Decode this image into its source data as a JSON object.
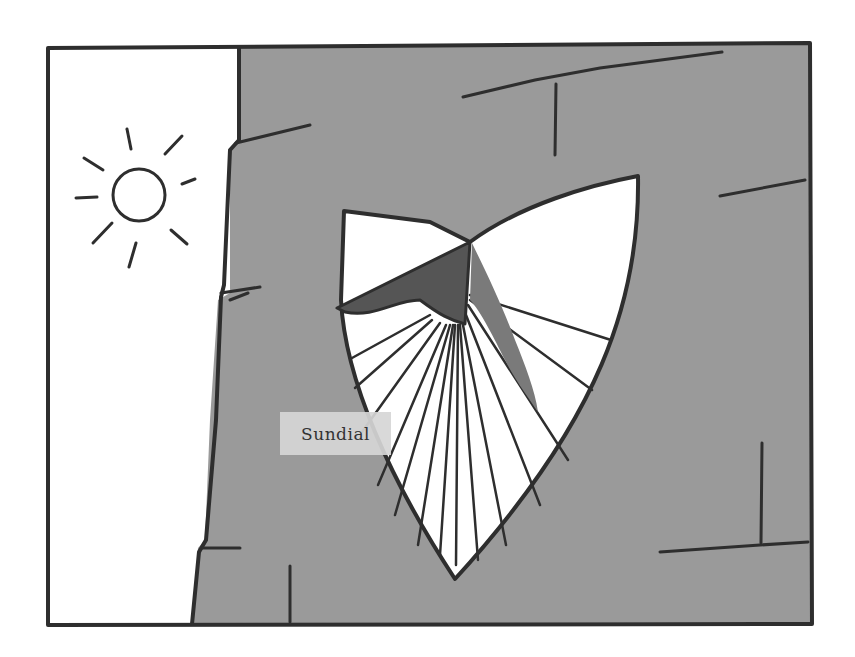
{
  "illustration": {
    "subject": "Sundial on a stone wall with sun",
    "colors": {
      "background": "#ffffff",
      "wall": "#9a9a9a",
      "outline": "#2e2e2e",
      "gnomon": "#555555",
      "shadow": "#7a7a7a",
      "dial_face": "#ffffff"
    },
    "icons": [
      "sun-icon"
    ],
    "labels": [
      {
        "id": "sundial",
        "text": "Sundial"
      }
    ]
  }
}
